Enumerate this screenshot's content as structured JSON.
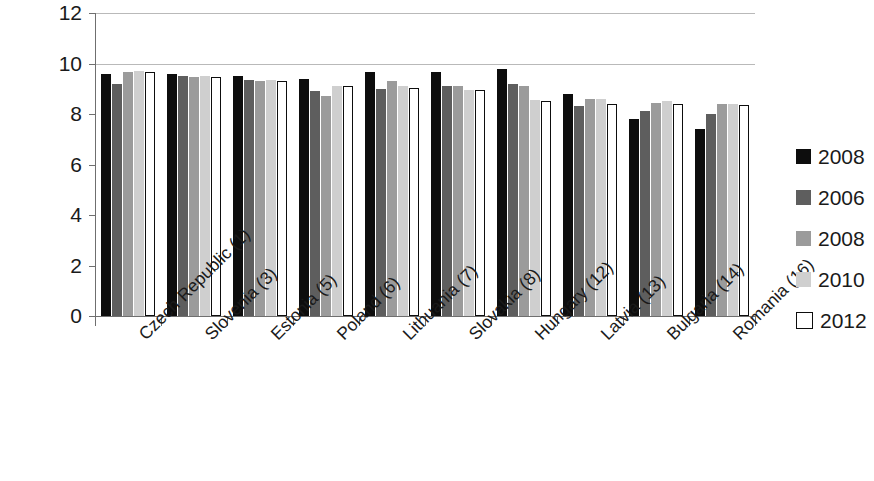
{
  "chart_data": {
    "type": "bar",
    "title": "",
    "subtitle": "",
    "xlabel": "",
    "ylabel": "",
    "ylim": [
      0,
      12
    ],
    "ytick_values": [
      0,
      2,
      4,
      6,
      8,
      10,
      12
    ],
    "ytick_labels": [
      "0",
      "2",
      "4",
      "6",
      "8",
      "10",
      "12"
    ],
    "grid": "horizontal gridlines at 10 and 12 only",
    "legend_position": "right",
    "categories": [
      "Czech Republic (1)",
      "Slovenia (3)",
      "Estonia (5)",
      "Poland (6)",
      "Lithuania (7)",
      "Slovakia (8)",
      "Hungary (12)",
      "Latvia (13)",
      "Bulgaria (14)",
      "Romania (16)"
    ],
    "series": [
      {
        "name": "2008",
        "color": "#0d0d0d",
        "values": [
          9.6,
          9.6,
          9.5,
          9.4,
          9.65,
          9.65,
          9.8,
          8.8,
          7.8,
          7.4
        ]
      },
      {
        "name": "2006",
        "color": "#5e5e5e",
        "values": [
          9.2,
          9.5,
          9.35,
          8.9,
          9.0,
          9.1,
          9.2,
          8.3,
          8.1,
          8.0
        ]
      },
      {
        "name": "2008",
        "color": "#9b9b9b",
        "values": [
          9.65,
          9.45,
          9.3,
          8.7,
          9.3,
          9.1,
          9.1,
          8.6,
          8.45,
          8.4
        ]
      },
      {
        "name": "2010",
        "color": "#cfcfcf",
        "values": [
          9.7,
          9.5,
          9.35,
          9.1,
          9.1,
          8.95,
          8.55,
          8.6,
          8.5,
          8.4
        ]
      },
      {
        "name": "2012",
        "color": "#ffffff",
        "values": [
          9.65,
          9.45,
          9.3,
          9.1,
          9.05,
          8.95,
          8.5,
          8.4,
          8.4,
          8.35
        ]
      }
    ]
  },
  "legend": {
    "items": [
      {
        "label": "2008",
        "swatch": "#0d0d0d",
        "outline": false
      },
      {
        "label": "2006",
        "swatch": "#5e5e5e",
        "outline": false
      },
      {
        "label": "2008",
        "swatch": "#9b9b9b",
        "outline": false
      },
      {
        "label": "2010",
        "swatch": "#cfcfcf",
        "outline": false
      },
      {
        "label": "2012",
        "swatch": "#ffffff",
        "outline": true
      }
    ]
  }
}
